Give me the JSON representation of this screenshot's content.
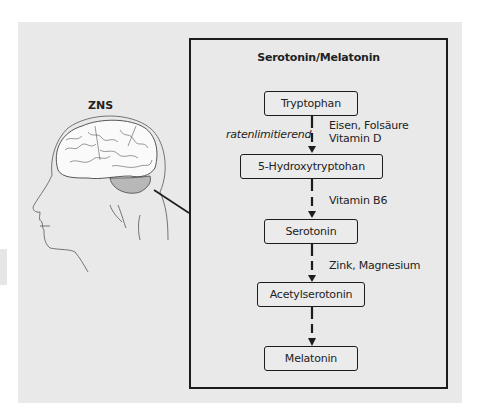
{
  "figure": {
    "left_label": "ZNS",
    "pathway_title": "Serotonin/Melatonin",
    "nodes": [
      {
        "label": "Tryptophan"
      },
      {
        "label": "5-Hydroxytryptohan"
      },
      {
        "label": "Serotonin"
      },
      {
        "label": "Acetylserotonin"
      },
      {
        "label": "Melatonin"
      }
    ],
    "steps": [
      {
        "from": "Tryptophan",
        "to": "5-Hydroxytryptohan",
        "cofactors": [
          "Eisen, Folsäure",
          "Vitamin D"
        ],
        "side_note": "ratenlimitierend"
      },
      {
        "from": "5-Hydroxytryptohan",
        "to": "Serotonin",
        "cofactors": [
          "Vitamin B6"
        ]
      },
      {
        "from": "Serotonin",
        "to": "Acetylserotonin",
        "cofactors": [
          "Zink, Magnesium"
        ]
      },
      {
        "from": "Acetylserotonin",
        "to": "Melatonin",
        "cofactors": []
      }
    ],
    "colors": {
      "panel_background": "#e9e9e9",
      "outline": "#1c1c1c",
      "cerebellum_fill": "#b8b8b8"
    }
  }
}
